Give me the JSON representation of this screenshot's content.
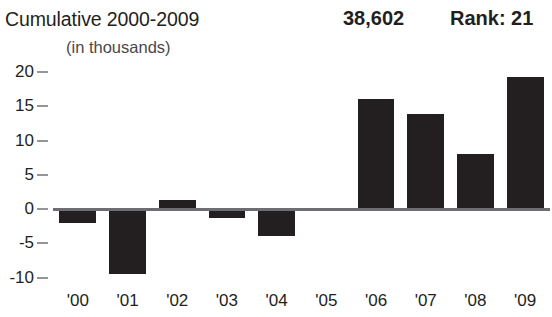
{
  "header": {
    "title": "Cumulative 2000-2009",
    "value": "38,602",
    "rank": "Rank: 21",
    "units": "(in thousands)",
    "clipped_title": ""
  },
  "colors": {
    "bar": "#231f20",
    "baseline": "#6d6e71",
    "tick": "#939598",
    "text": "#231f20",
    "subtext": "#4b4849",
    "background": "#ffffff"
  },
  "chart_data": {
    "type": "bar",
    "title": "Cumulative 2000-2009",
    "subtitle": "(in thousands)",
    "xlabel": "",
    "ylabel": "",
    "units": "thousands",
    "categories": [
      "'00",
      "'01",
      "'02",
      "'03",
      "'04",
      "'05",
      "'06",
      "'07",
      "'08",
      "'09"
    ],
    "values": [
      -2.0,
      -9.5,
      1.3,
      -1.3,
      -4.0,
      0.0,
      16.0,
      13.8,
      8.0,
      19.3
    ],
    "ylim": [
      -10,
      20
    ],
    "yticks": [
      20,
      15,
      10,
      5,
      0,
      -5,
      -10
    ],
    "ytick_labels": [
      "20",
      "15",
      "10",
      "5",
      "0",
      "-5",
      "-10"
    ],
    "grid": false,
    "legend": false,
    "annotations": [
      {
        "label": "cumulative_total",
        "text": "38,602"
      },
      {
        "label": "rank",
        "text": "Rank: 21"
      }
    ]
  },
  "axis_geometry": {
    "zero_y_px": 209,
    "px_per_unit": 6.85,
    "plot_left_px": 53,
    "plot_right_px": 550
  }
}
